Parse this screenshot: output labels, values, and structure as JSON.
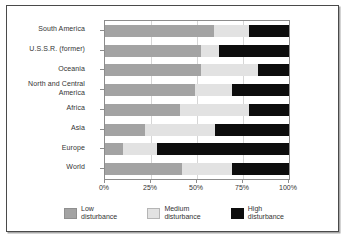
{
  "chart_data": {
    "type": "bar",
    "orientation": "horizontal",
    "stacked": true,
    "stack_mode": "percent",
    "title": "",
    "subtitle": "",
    "xlabel": "",
    "ylabel": "",
    "xlim": [
      0,
      100
    ],
    "xticks": [
      0,
      25,
      50,
      75,
      100
    ],
    "xticklabels": [
      "0%",
      "25%",
      "50%",
      "75%",
      "100%"
    ],
    "grid": true,
    "legend_position": "bottom",
    "categories": [
      "South America",
      "U.S.S.R. (former)",
      "Oceania",
      "North and Central\nAmerica",
      "Africa",
      "Asia",
      "Europe",
      "World"
    ],
    "series": [
      {
        "name": "Low disturbance",
        "color": "#a3a3a3",
        "values": [
          59,
          52,
          52,
          49,
          41,
          22,
          10,
          42
        ]
      },
      {
        "name": "Medium disturbance",
        "color": "#e2e2e2",
        "values": [
          19,
          10,
          31,
          20,
          37,
          38,
          18,
          27
        ]
      },
      {
        "name": "High disturbance",
        "color": "#0d0d0d",
        "values": [
          22,
          38,
          17,
          31,
          22,
          40,
          72,
          31
        ]
      }
    ]
  },
  "axis": {
    "tick_labels": [
      "0%",
      "25%",
      "50%",
      "75%",
      "100%"
    ],
    "tick_values": [
      0,
      25,
      50,
      75,
      100
    ]
  },
  "category_labels": [
    "South America",
    "U.S.S.R. (former)",
    "Oceania",
    "North and Central America",
    "Africa",
    "Asia",
    "Europe",
    "World"
  ],
  "legend": {
    "items": [
      {
        "label": "Low\ndisturbance",
        "color": "#a3a3a3"
      },
      {
        "label": "Medium\ndisturbance",
        "color": "#e2e2e2"
      },
      {
        "label": "High\ndisturbance",
        "color": "#0d0d0d"
      }
    ]
  }
}
